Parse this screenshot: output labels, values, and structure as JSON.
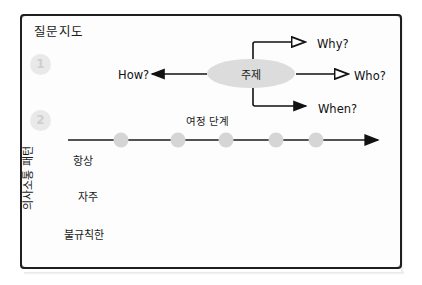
{
  "diagram": {
    "title": "질문지도",
    "frame_color": "#1d1d1d",
    "background_color": "#fdfdfd"
  },
  "sections": [
    {
      "badge": "1",
      "name": "question-map-section"
    },
    {
      "badge": "2",
      "name": "communication-pattern-section"
    }
  ],
  "topic": {
    "label": "주제",
    "fill_color": "#dcdcdc"
  },
  "questions": [
    {
      "label": "How?",
      "direction": "left",
      "arrowhead": "solid"
    },
    {
      "label": "Why?",
      "direction": "right",
      "arrowhead": "hollow"
    },
    {
      "label": "Who?",
      "direction": "right",
      "arrowhead": "hollow"
    },
    {
      "label": "When?",
      "direction": "right",
      "arrowhead": "solid"
    }
  ],
  "timeline": {
    "stage_label": "여정 단계",
    "node_color": "#d5d5d5",
    "line_color": "#1a1a1a",
    "node_count": 5
  },
  "axis": {
    "vertical_label": "의사소통 패턴",
    "frequency_labels": [
      "항상",
      "자주",
      "불규칙한"
    ]
  }
}
